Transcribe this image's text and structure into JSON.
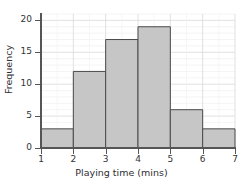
{
  "chart_data": {
    "type": "bar",
    "title": "",
    "subtitle": "",
    "xlabel": "Playing time (mins)",
    "ylabel": "Frequency",
    "categories": [
      "1-2",
      "2-3",
      "3-4",
      "4-5",
      "5-6",
      "6-7"
    ],
    "bin_edges": [
      1,
      2,
      3,
      4,
      5,
      6,
      7
    ],
    "values": [
      3,
      12,
      17,
      19,
      6,
      3
    ],
    "xlim": [
      1,
      7
    ],
    "ylim": [
      0,
      21
    ],
    "x_ticks": [
      1,
      2,
      3,
      4,
      5,
      6,
      7
    ],
    "x_tick_labels": [
      "1",
      "2",
      "3",
      "4",
      "5",
      "6",
      "7"
    ],
    "y_ticks": [
      0,
      5,
      10,
      15,
      20
    ],
    "y_tick_labels": [
      "0",
      "5",
      "10",
      "15",
      "20"
    ],
    "grid": true,
    "legend": false,
    "legend_position": "none",
    "bar_fill_color": "#c6c6c6",
    "bar_edge_color": "#4a4a4a",
    "grid_color": "#d9d9dd",
    "axis_color": "#555558",
    "text_color": "#2e2e31"
  }
}
